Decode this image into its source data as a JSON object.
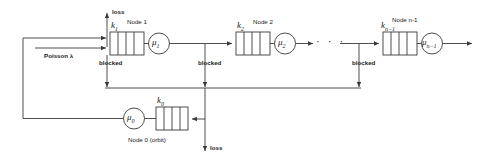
{
  "diagram": {
    "type": "queueing-network-diagram",
    "stroke_color": "#3a3a3a",
    "text_color": "#1a1a1a",
    "background": "#ffffff"
  },
  "labels": {
    "loss_top": "loss",
    "loss_bottom": "loss",
    "arrival": "Poisson λ",
    "blocked_1": "blocked",
    "blocked_2": "blocked",
    "blocked_3": "blocked",
    "ellipsis": "· · ·"
  },
  "nodes": [
    {
      "id": "node1",
      "name": "Node 1",
      "buffer_label": "k",
      "buffer_sub": "1",
      "server_label": "μ",
      "server_sub": "1",
      "blocked_label": "blocked"
    },
    {
      "id": "node2",
      "name": "Node 2",
      "buffer_label": "k",
      "buffer_sub": "2",
      "server_label": "μ",
      "server_sub": "2",
      "blocked_label": "blocked"
    },
    {
      "id": "node_n_minus_1",
      "name": "Node n-1",
      "buffer_label": "k",
      "buffer_sub": "n−1",
      "server_label": "μ",
      "server_sub": "n−1",
      "blocked_label": "blocked"
    },
    {
      "id": "node0",
      "name": "Node 0 (orbit)",
      "buffer_label": "k",
      "buffer_sub": "0",
      "server_label": "μ",
      "server_sub": "0",
      "blocked_label": ""
    }
  ]
}
